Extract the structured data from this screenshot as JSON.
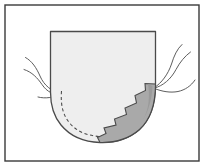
{
  "figure": {
    "caption": "",
    "width": 205,
    "height": 167,
    "background_color": "#ffffff",
    "frame": {
      "label": "figure-border",
      "stroke_color": "#3a3a3a",
      "stroke_width": 1.4,
      "x": 5,
      "y": 5,
      "width": 194,
      "height": 156
    },
    "elements": [
      {
        "name": "body-outline",
        "label": "Main structure cross-section",
        "fill_color": "#eeeeee",
        "stroke_color": "#4a4a4a",
        "path": "M 50.5 31.5 L 155.5 31.5 L 155.5 86 C 155.5 104 150 120 139 130 C 128 139.5 114 143 100 142.5 C 84 142 70 136 61 125 C 53.5 116 50.5 105 50.5 92 Z"
      },
      {
        "name": "lesion-band",
        "label": "Serrated gray band along inferior-lateral margin",
        "fill_color": "#a9a9a9",
        "stroke_color": "#4a4a4a",
        "path": "M 155.5 84 C 155.5 103 150.5 119.5 139.5 129.5 C 128.5 139 114 142.8 100 142.4 L 97.5 137.5 L 106 133.5 L 104 128 L 116 125 L 114.5 119 L 126.5 114.5 L 125 108 L 136.5 103 L 135 95.5 L 145.5 90.5 L 145 83.5 Z"
      },
      {
        "name": "band-inner-shade",
        "label": "Darker inner shading of gray band",
        "fill_color": "#9a9a9a",
        "path": "M 148 84 C 150 96 149 110 143 120 C 148.5 111 152 99 152.5 86 Z"
      },
      {
        "name": "dashed-contour",
        "label": "Dashed internal boundary line",
        "stroke_color": "#4a4a4a",
        "dash_pattern": "3.2 2.6",
        "path": "M 61.5 91 C 60.5 104 62.5 115 70 123.5 C 78 132.5 88 135.5 99 136.5"
      }
    ],
    "fibers": {
      "label": "Thin curved filaments attached to the structure",
      "stroke_color": "#545454",
      "left_group": [
        "M 61 93.5 C 54 95.5 47 92 42 84.5 C 37.5 78 32 72 24 69.5",
        "M 61 93 C 52 92 44 85.5 40 76 C 36.5 68 32 61 25.5 57.5",
        "M 61 93.8 C 54.5 97.5 45.5 99 38 97"
      ],
      "right_group": [
        "M 154.5 87.5 C 161.5 83 168 74.5 171.5 64 C 174 56 177 49 182 44.5",
        "M 154.5 88 C 163 86 171 79 176 69.5 C 180 62 185 56 190.5 52",
        "M 154.5 88.5 C 162 91.5 170 93 178 91.5 C 185 90 191 86 195 80"
      ]
    }
  }
}
